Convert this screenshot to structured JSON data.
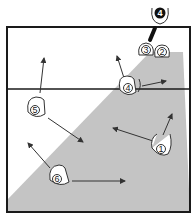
{
  "diagram": {
    "type": "volleyball-court-rotation",
    "colors": {
      "court_line": "#1a1a1a",
      "shaded_zone": "#c4c4c4",
      "background": "#ffffff",
      "player_outline": "#333333",
      "server_fill": "#111111"
    },
    "court": {
      "left": 7,
      "right": 190,
      "top": 27,
      "bottom": 212,
      "net_y": 89
    },
    "shaded_zone": {
      "points": [
        [
          150,
          52
        ],
        [
          183,
          52
        ],
        [
          190,
          212
        ],
        [
          7,
          212
        ],
        [
          7,
          200
        ]
      ]
    },
    "players": [
      {
        "id": "p4-server",
        "label": "4",
        "x": 160,
        "y": 13,
        "role": "server"
      },
      {
        "id": "p3",
        "label": "3",
        "x": 146,
        "y": 50
      },
      {
        "id": "p2",
        "label": "2",
        "x": 162,
        "y": 52
      },
      {
        "id": "p4",
        "label": "4",
        "x": 128,
        "y": 88
      },
      {
        "id": "p5",
        "label": "5",
        "x": 36,
        "y": 110
      },
      {
        "id": "p1",
        "label": "1",
        "x": 161,
        "y": 148
      },
      {
        "id": "p6",
        "label": "6",
        "x": 58,
        "y": 177
      }
    ],
    "arrows": [
      {
        "from": [
          40,
          93
        ],
        "to": [
          44,
          58
        ]
      },
      {
        "from": [
          124,
          78
        ],
        "to": [
          117,
          56
        ]
      },
      {
        "from": [
          142,
          86
        ],
        "to": [
          166,
          81
        ]
      },
      {
        "from": [
          48,
          118
        ],
        "to": [
          83,
          142
        ]
      },
      {
        "from": [
          153,
          141
        ],
        "to": [
          113,
          128
        ]
      },
      {
        "from": [
          163,
          135
        ],
        "to": [
          172,
          114
        ]
      },
      {
        "from": [
          50,
          168
        ],
        "to": [
          28,
          143
        ]
      },
      {
        "from": [
          72,
          181
        ],
        "to": [
          125,
          181
        ]
      }
    ]
  }
}
